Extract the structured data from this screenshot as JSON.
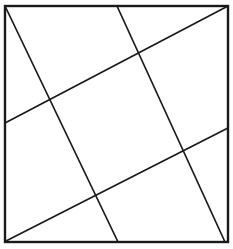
{
  "figure": {
    "background_color": "#ffffff",
    "stroke_color": "#1a1a1a",
    "canvas": {
      "width": 233,
      "height": 249
    },
    "frame": {
      "name": "outer-square",
      "x1": 5,
      "y1": 6,
      "x2": 228,
      "y2": 242,
      "stroke_width": 2.4,
      "corners": {
        "top_left": [
          5,
          6
        ],
        "top_right": [
          228,
          6
        ],
        "bottom_right": [
          228,
          242
        ],
        "bottom_left": [
          5,
          242
        ]
      }
    },
    "lines": [
      {
        "id": "line-a1",
        "label": "shallow-upper",
        "family": "A",
        "x1": 5,
        "y1": 123,
        "x2": 228,
        "y2": 6,
        "stroke_width": 1.7
      },
      {
        "id": "line-a2",
        "label": "shallow-lower",
        "family": "A",
        "x1": 6,
        "y1": 241,
        "x2": 228,
        "y2": 128,
        "stroke_width": 1.7
      },
      {
        "id": "line-b1",
        "label": "steep-left",
        "family": "B",
        "x1": 5,
        "y1": 6,
        "x2": 118,
        "y2": 242,
        "stroke_width": 1.7
      },
      {
        "id": "line-b2",
        "label": "steep-right",
        "family": "B",
        "x1": 117,
        "y1": 6,
        "x2": 225,
        "y2": 242,
        "stroke_width": 1.7
      }
    ],
    "intersections": [
      {
        "id": "node-a1-b1",
        "x": 50,
        "y": 102
      },
      {
        "id": "node-a1-b2",
        "x": 140,
        "y": 52
      },
      {
        "id": "node-a2-b1",
        "x": 95,
        "y": 195
      },
      {
        "id": "node-a2-b2",
        "x": 185,
        "y": 148
      }
    ]
  }
}
